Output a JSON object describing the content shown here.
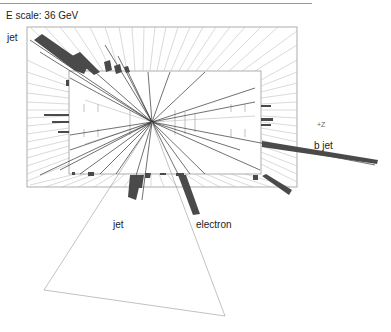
{
  "header": {
    "energy_scale": "E scale: 36 GeV"
  },
  "labels": {
    "jet_top_left": "jet",
    "jet_bottom": "jet",
    "electron": "electron",
    "b_jet": "b jet",
    "axis_z": "+Z"
  },
  "colors": {
    "deposit": "#4a4a4a",
    "track": "#333333",
    "grid_line": "#b0b0b0",
    "frame": "#999999"
  },
  "detector": {
    "outer_frame": {
      "x": 27,
      "y": 27,
      "w": 270,
      "h": 160
    },
    "inner_frame": {
      "x": 69,
      "y": 71,
      "w": 192,
      "h": 103
    },
    "vertex": {
      "x": 152,
      "y": 122
    }
  }
}
